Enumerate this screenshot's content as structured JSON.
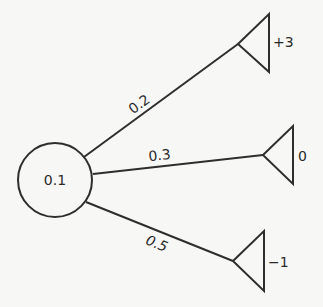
{
  "diagram": {
    "type": "decision-tree",
    "root": {
      "label": "0.1"
    },
    "branches": [
      {
        "probability": "0.2",
        "outcome": "+3"
      },
      {
        "probability": "0.3",
        "outcome": "0"
      },
      {
        "probability": "0.5",
        "outcome": "−1"
      }
    ]
  },
  "colors": {
    "line": "#2e2e2e",
    "background": "#f7f7f5"
  }
}
